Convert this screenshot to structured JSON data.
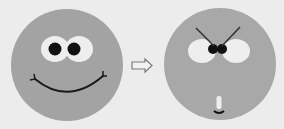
{
  "figure": {
    "description": "Two cartoon faces: a happy smiling face transforms (arrow) into an angry/surprised face",
    "colors": {
      "background": "#ececec",
      "face_fill": "#a3a3a3",
      "eye_white": "#eeeeee",
      "pupil": "#111111",
      "line": "#1a1a1a",
      "arrow_stroke": "#7a7a7a"
    },
    "faces": [
      {
        "name": "happy-face",
        "expression": "smiling"
      },
      {
        "name": "angry-face",
        "expression": "angry, small open mouth"
      }
    ],
    "arrow": {
      "direction": "right",
      "style": "outlined"
    }
  }
}
